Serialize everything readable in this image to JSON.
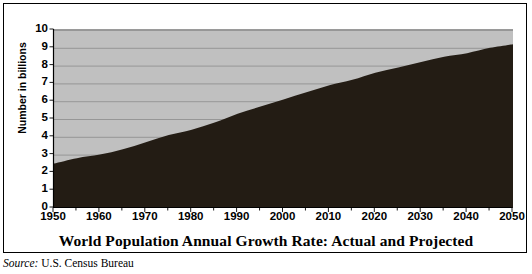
{
  "chart_data": {
    "type": "area",
    "title": "World Population Annual Growth Rate: Actual and Projected",
    "xlabel": "",
    "ylabel": "Number in billions",
    "x": [
      1950,
      1955,
      1960,
      1965,
      1970,
      1975,
      1980,
      1985,
      1990,
      1995,
      2000,
      2005,
      2010,
      2015,
      2020,
      2025,
      2030,
      2035,
      2040,
      2045,
      2050
    ],
    "values": [
      2.5,
      2.8,
      3.0,
      3.3,
      3.7,
      4.1,
      4.4,
      4.8,
      5.3,
      5.7,
      6.1,
      6.5,
      6.9,
      7.2,
      7.6,
      7.9,
      8.2,
      8.5,
      8.7,
      9.0,
      9.2
    ],
    "series": [
      {
        "name": "World population",
        "values": [
          2.5,
          2.8,
          3.0,
          3.3,
          3.7,
          4.1,
          4.4,
          4.8,
          5.3,
          5.7,
          6.1,
          6.5,
          6.9,
          7.2,
          7.6,
          7.9,
          8.2,
          8.5,
          8.7,
          9.0,
          9.2
        ]
      }
    ],
    "x_ticks": [
      1950,
      1960,
      1970,
      1980,
      1990,
      2000,
      2010,
      2020,
      2030,
      2040,
      2050
    ],
    "x_tick_labels": [
      "1950",
      "1960",
      "1970",
      "1980",
      "1990",
      "2000",
      "2010",
      "2020",
      "2030",
      "2040",
      "2050"
    ],
    "x_minor_tick_interval": 5,
    "y_ticks": [
      0,
      1,
      2,
      3,
      4,
      5,
      6,
      7,
      8,
      9,
      10
    ],
    "y_tick_labels": [
      "0",
      "1",
      "2",
      "3",
      "4",
      "5",
      "6",
      "7",
      "8",
      "9",
      "10"
    ],
    "xlim": [
      1950,
      2050
    ],
    "ylim": [
      0,
      10
    ],
    "grid": "horizontal",
    "legend": "none",
    "colors": {
      "area_fill": "#231c14",
      "plot_background": "#c0c0c0",
      "gridline": "#8c8c8c",
      "axis": "#000000",
      "figure_background": "#ffffff",
      "text": "#000000"
    }
  },
  "figure": {
    "title": "World Population Annual Growth Rate: Actual and Projected",
    "source_label": "Source:",
    "source_value": "U.S. Census Bureau",
    "y_axis_title": "Number in billions"
  }
}
